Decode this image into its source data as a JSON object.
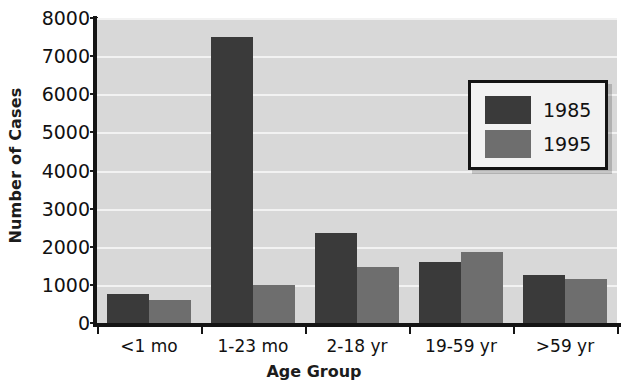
{
  "chart_data": {
    "type": "bar",
    "title": "",
    "xlabel": "Age Group",
    "ylabel": "Number of Cases",
    "categories": [
      "<1 mo",
      "1-23 mo",
      "2-18 yr",
      "19-59 yr",
      ">59 yr"
    ],
    "series": [
      {
        "name": "1985",
        "color": "#3a3a3a",
        "values": [
          750,
          7500,
          2350,
          1600,
          1250
        ]
      },
      {
        "name": "1995",
        "color": "#6e6e6e",
        "values": [
          600,
          1000,
          1470,
          1850,
          1150
        ]
      }
    ],
    "ylim": [
      0,
      8000
    ],
    "yticks": [
      0,
      1000,
      2000,
      3000,
      4000,
      5000,
      6000,
      7000,
      8000
    ],
    "ytick_labels": [
      "0",
      "1000",
      "2000",
      "3000",
      "4000",
      "5000",
      "6000",
      "7000",
      "8000"
    ],
    "grid": true,
    "grid_color": "#f2f2f2",
    "plot_background": "#d8d8d8",
    "legend_position": "upper right",
    "legend_entries": [
      "1985",
      "1995"
    ]
  }
}
